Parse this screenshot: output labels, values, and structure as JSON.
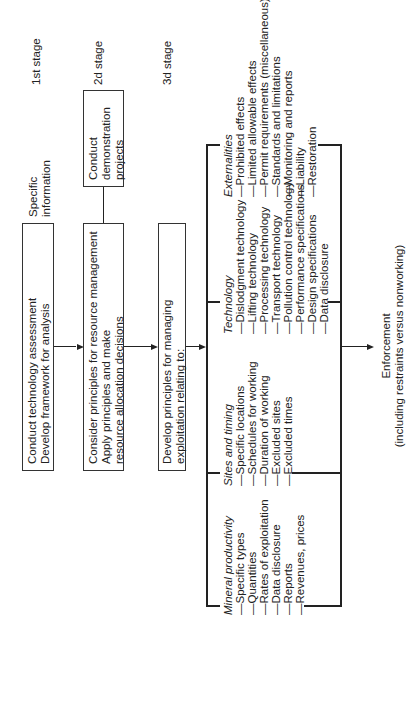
{
  "stages": {
    "first": "1st stage",
    "second": "2d stage",
    "third": "3d stage"
  },
  "input": {
    "label_line1": "Specific",
    "label_line2": "information"
  },
  "boxes": {
    "assessment": {
      "line1": "Conduct technology assessment",
      "line2": "Develop framework for analysis"
    },
    "resource_management": {
      "line1": "Consider principles for resource management",
      "line2": "Apply principles and make",
      "line3": "resource allocation decisions"
    },
    "demonstration": {
      "line1": "Conduct",
      "line2": "demonstration",
      "line3": "projects"
    },
    "exploitation": {
      "line1": "Develop principles for managing",
      "line2": "exploitation relating to:"
    }
  },
  "groups": {
    "mineral_productivity": {
      "title": "Mineral productivity",
      "items": [
        "—Specific types",
        "—Quantities",
        "—Rates of exploitation",
        "—Data disclosure",
        "—Reports",
        "—Revenues, prices"
      ]
    },
    "sites_and_timing": {
      "title": "Sites and timing",
      "items": [
        "—Specific locations",
        "—Schedules for working",
        "—Duration of working",
        "—Excluded sites",
        "—Excluded times"
      ]
    },
    "technology": {
      "title": "Technology",
      "items": [
        "—Dislodgment technology",
        "—Lifting technology",
        "—Processing technology",
        "—Transport technology",
        "—Pollution control technology",
        "—Performance specifications",
        "—Design specifications",
        "—Data disclosure"
      ]
    },
    "externalities": {
      "title": "Externalities",
      "items": [
        "—Prohibited effects",
        "—Limited allowable effects",
        "—Permit requirements (miscellaneous)",
        "—Standards and limitations",
        "—Monitoring and reports",
        "—Liability",
        "—Restoration"
      ]
    }
  },
  "output": {
    "line1": "Enforcement",
    "line2": "(including restraints versus nonworking)"
  }
}
